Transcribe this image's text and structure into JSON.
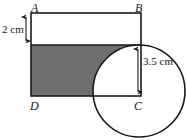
{
  "figure": {
    "vertices": [
      {
        "id": "A",
        "label": "A",
        "x": 31,
        "y": 13
      },
      {
        "id": "B",
        "label": "B",
        "x": 141,
        "y": 13
      },
      {
        "id": "C",
        "label": "C",
        "x": 141,
        "y": 96
      },
      {
        "id": "D",
        "label": "D",
        "x": 31,
        "y": 96
      }
    ],
    "dimensions": [
      {
        "id": "top-strip-height",
        "label": "2 cm",
        "value": 2,
        "unit": "cm",
        "from_y": 17,
        "to_y": 45
      },
      {
        "id": "circle-radius",
        "label": "3.5 cm",
        "value": 3.5,
        "unit": "cm",
        "from_y": 48,
        "to_y": 94
      }
    ],
    "shapes": {
      "rectangle": {
        "x": 31,
        "y": 13,
        "width": 110,
        "height": 83
      },
      "shaded_band": {
        "x": 31,
        "y": 45,
        "width": 110,
        "height": 51
      },
      "circle": {
        "cx": 139,
        "cy": 91,
        "r": 46
      }
    },
    "colors": {
      "stroke": "#1a1a1a",
      "shade_fill": "#6f6f6f",
      "background": "#ffffff"
    }
  }
}
